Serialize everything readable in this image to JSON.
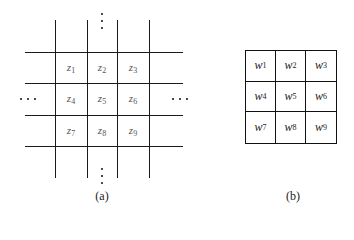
{
  "panel_a": {
    "caption": "(a)",
    "grid_labels": [
      {
        "var": "z",
        "sub": "1"
      },
      {
        "var": "z",
        "sub": "2"
      },
      {
        "var": "z",
        "sub": "3"
      },
      {
        "var": "z",
        "sub": "4"
      },
      {
        "var": "z",
        "sub": "5"
      },
      {
        "var": "z",
        "sub": "6"
      },
      {
        "var": "z",
        "sub": "7"
      },
      {
        "var": "z",
        "sub": "8"
      },
      {
        "var": "z",
        "sub": "9"
      }
    ],
    "ellipsis": "..."
  },
  "panel_b": {
    "caption": "(b)",
    "grid_labels": [
      {
        "var": "w",
        "sub": "1"
      },
      {
        "var": "w",
        "sub": "2"
      },
      {
        "var": "w",
        "sub": "3"
      },
      {
        "var": "w",
        "sub": "4"
      },
      {
        "var": "w",
        "sub": "5"
      },
      {
        "var": "w",
        "sub": "6"
      },
      {
        "var": "w",
        "sub": "7"
      },
      {
        "var": "w",
        "sub": "8"
      },
      {
        "var": "w",
        "sub": "9"
      }
    ]
  }
}
